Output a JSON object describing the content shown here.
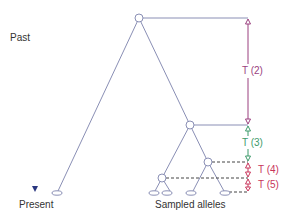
{
  "labels": {
    "past": "Past",
    "present": "Present",
    "sampled": "Sampled alleles"
  },
  "intervals": [
    {
      "id": "t2",
      "label": "T (2)",
      "color": "#9a3f7e"
    },
    {
      "id": "t3",
      "label": "T (3)",
      "color": "#3d9a6a"
    },
    {
      "id": "t4",
      "label": "T (4)",
      "color": "#c8345a"
    },
    {
      "id": "t5",
      "label": "T (5)",
      "color": "#c8345a"
    }
  ],
  "colors": {
    "tree": "#8a8fb5",
    "arrow_top": "#c9cad8",
    "arrow_bottom": "#2a3780",
    "text": "#333333"
  },
  "tree": {
    "sampled_alleles_count": 5
  }
}
